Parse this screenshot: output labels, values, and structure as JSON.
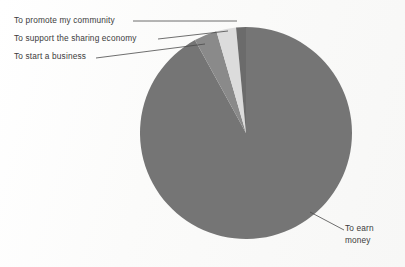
{
  "figure": {
    "background_color": "#fdfdfc",
    "text_color": "#3b3b3b",
    "leader_line_color": "#4a4a4a"
  },
  "chart_data": {
    "type": "pie",
    "title": "",
    "subtitle": "",
    "xlabel": "",
    "ylabel": "",
    "legend_position": "callout-labels",
    "grid": false,
    "start_angle_deg": 0,
    "direction": "clockwise",
    "center": {
      "x": 246,
      "y": 133
    },
    "radius": 106,
    "categories": [
      "To earn money",
      "To start a business",
      "To support the sharing economy",
      "To promote my community"
    ],
    "values": [
      92.0,
      3.5,
      3.0,
      1.5
    ],
    "slices": [
      {
        "label": "To earn money",
        "value": 92.0,
        "color": "#757575",
        "start_angle_deg": 25.2,
        "end_angle_deg": 356.4,
        "label_lines": [
          "To earn",
          "money"
        ],
        "label_side": "right"
      },
      {
        "label": "To start a business",
        "value": 3.5,
        "color": "#8a8a8a",
        "start_angle_deg": 356.4,
        "end_angle_deg": 369.0,
        "label_lines": [
          "To start a business"
        ],
        "label_side": "left"
      },
      {
        "label": "To support the sharing economy",
        "value": 3.0,
        "color": "#dcdcdc",
        "start_angle_deg": 369.0,
        "end_angle_deg": 379.8,
        "label_lines": [
          "To support the sharing economy"
        ],
        "label_side": "left"
      },
      {
        "label": "To promote my community",
        "value": 1.5,
        "color": "#6b6b6b",
        "start_angle_deg": 379.8,
        "end_angle_deg": 385.2,
        "label_lines": [
          "To promote my community"
        ],
        "label_side": "left"
      }
    ]
  },
  "labels": {
    "promote": "To promote my community",
    "support": "To support the sharing economy",
    "business": "To start a business",
    "earn_line1": "To earn",
    "earn_line2": "money"
  },
  "leader_lines": [
    {
      "name": "leader-promote",
      "x1": 133,
      "y1": 21,
      "x2": 237,
      "y2": 21
    },
    {
      "name": "leader-support",
      "x1": 158,
      "y1": 39,
      "x2": 228,
      "y2": 31
    },
    {
      "name": "leader-business",
      "x1": 96,
      "y1": 58,
      "x2": 205,
      "y2": 44
    },
    {
      "name": "leader-earn",
      "x1": 310,
      "y1": 212,
      "x2": 344,
      "y2": 230
    }
  ]
}
